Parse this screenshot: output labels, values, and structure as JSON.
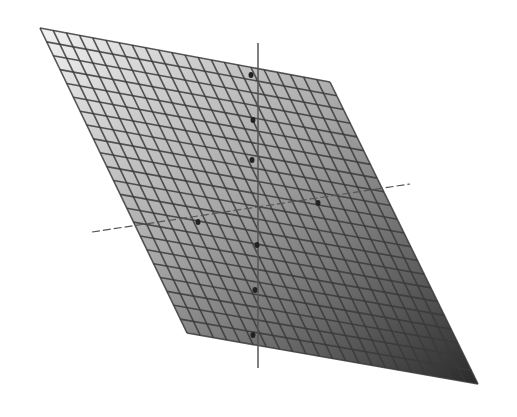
{
  "figure": {
    "background": "#ffffff",
    "plane": {
      "corners": {
        "top_left": [
          40,
          28
        ],
        "top_right": [
          330,
          82
        ],
        "bottom_right": [
          478,
          384
        ],
        "bottom_left": [
          187,
          333
        ]
      },
      "grid_rows": 22,
      "grid_cols": 22,
      "gradient_start": "#f2f2f2",
      "gradient_end": "#2a2a2a",
      "grid_color": "#3a3a3a"
    },
    "axes": {
      "vertical": {
        "x": 258,
        "y_top": 43,
        "y_bottom": 368
      },
      "horizontal_a": {
        "from": [
          92,
          232
        ],
        "to": [
          410,
          184
        ]
      },
      "color": "#555555"
    },
    "tick_markers": [
      [
        251,
        75
      ],
      [
        253,
        120
      ],
      [
        252,
        160
      ],
      [
        198,
        222
      ],
      [
        318,
        203
      ],
      [
        257,
        245
      ],
      [
        255,
        290
      ],
      [
        253,
        335
      ]
    ]
  }
}
